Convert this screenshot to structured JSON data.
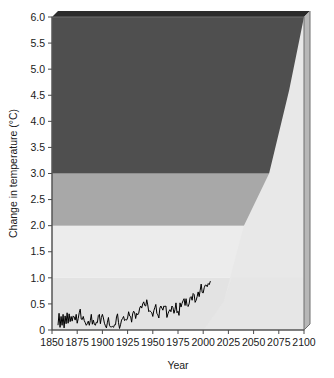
{
  "chart_data": {
    "type": "area",
    "title": "",
    "xlabel": "Year",
    "ylabel": "Change in temperature (°C)",
    "xlim": [
      1850,
      2100
    ],
    "ylim": [
      0,
      6
    ],
    "grid": false,
    "legend": null,
    "x_ticks": [
      1850,
      1875,
      1900,
      1925,
      1950,
      1975,
      2000,
      2025,
      2050,
      2075,
      2100
    ],
    "x_tick_labels": [
      "1850",
      "1875",
      "1900",
      "1925",
      "1950",
      "1975",
      "2000",
      "2025",
      "2050",
      "2075",
      "2100"
    ],
    "y_ticks": [
      0,
      0.5,
      1.0,
      1.5,
      2.0,
      2.5,
      3.0,
      3.5,
      4.0,
      4.5,
      5.0,
      5.5,
      6.0
    ],
    "y_tick_labels": [
      "0",
      "0.5",
      "1.0",
      "1.5",
      "2.0",
      "2.5",
      "3.0",
      "3.5",
      "4.0",
      "4.5",
      "5.0",
      "5.5",
      "6.0"
    ],
    "bands": [
      {
        "name": "below-1C-band",
        "label": "Below 1.0 °C",
        "y_range": [
          0,
          1.0
        ],
        "color": "#e3e3e3"
      },
      {
        "name": "1-to-2C-band",
        "label": "1.0 to 2.0 °C",
        "y_range": [
          1.0,
          2.0
        ],
        "color": "#ececec"
      },
      {
        "name": "2-to-3C-band",
        "label": "2.0 to 3.0 °C",
        "y_range": [
          2.0,
          3.0
        ],
        "color": "#a8a8a8"
      },
      {
        "name": "above-3C-band",
        "label": "Above 3.0 °C",
        "y_range": [
          3.0,
          6.0
        ],
        "color": "#4f4f4f"
      }
    ],
    "projection_wedge": {
      "name": "projection-uncertainty-wedge",
      "color": "#e8e8e8",
      "description": "Light wedge rising from baseline toward upper right, overlaying the shaded bands",
      "boundary_points": [
        {
          "x": 2000,
          "y": 0.0
        },
        {
          "x": 2020,
          "y": 0.55
        },
        {
          "x": 2040,
          "y": 2.0
        },
        {
          "x": 2065,
          "y": 3.0
        },
        {
          "x": 2085,
          "y": 4.6
        },
        {
          "x": 2100,
          "y": 6.0
        }
      ]
    },
    "series": [
      {
        "name": "observed-global-temperature",
        "label": "Observed change in temperature",
        "color": "#000000",
        "x_start": 1856,
        "x_end": 2007,
        "points": [
          [
            1856,
            0.1
          ],
          [
            1857,
            0.32
          ],
          [
            1858,
            0.05
          ],
          [
            1859,
            0.26
          ],
          [
            1860,
            0.09
          ],
          [
            1861,
            0.3
          ],
          [
            1862,
            0.04
          ],
          [
            1863,
            0.27
          ],
          [
            1864,
            0.12
          ],
          [
            1865,
            0.33
          ],
          [
            1866,
            0.13
          ],
          [
            1867,
            0.31
          ],
          [
            1868,
            0.16
          ],
          [
            1869,
            0.26
          ],
          [
            1870,
            0.17
          ],
          [
            1871,
            0.27
          ],
          [
            1872,
            0.25
          ],
          [
            1873,
            0.19
          ],
          [
            1874,
            0.3
          ],
          [
            1875,
            0.13
          ],
          [
            1876,
            0.22
          ],
          [
            1877,
            0.33
          ],
          [
            1878,
            0.4
          ],
          [
            1879,
            0.21
          ],
          [
            1880,
            0.2
          ],
          [
            1881,
            0.26
          ],
          [
            1882,
            0.18
          ],
          [
            1883,
            0.14
          ],
          [
            1884,
            0.09
          ],
          [
            1885,
            0.12
          ],
          [
            1886,
            0.17
          ],
          [
            1887,
            0.09
          ],
          [
            1888,
            0.18
          ],
          [
            1889,
            0.3
          ],
          [
            1890,
            0.11
          ],
          [
            1891,
            0.19
          ],
          [
            1892,
            0.11
          ],
          [
            1893,
            0.09
          ],
          [
            1894,
            0.15
          ],
          [
            1895,
            0.14
          ],
          [
            1896,
            0.28
          ],
          [
            1897,
            0.3
          ],
          [
            1898,
            0.12
          ],
          [
            1899,
            0.24
          ],
          [
            1900,
            0.3
          ],
          [
            1901,
            0.23
          ],
          [
            1902,
            0.13
          ],
          [
            1903,
            0.08
          ],
          [
            1904,
            0.04
          ],
          [
            1905,
            0.15
          ],
          [
            1906,
            0.24
          ],
          [
            1907,
            0.09
          ],
          [
            1908,
            0.06
          ],
          [
            1909,
            0.06
          ],
          [
            1910,
            0.07
          ],
          [
            1911,
            0.05
          ],
          [
            1912,
            0.1
          ],
          [
            1913,
            0.1
          ],
          [
            1914,
            0.25
          ],
          [
            1915,
            0.31
          ],
          [
            1916,
            0.14
          ],
          [
            1917,
            0.03
          ],
          [
            1918,
            0.1
          ],
          [
            1919,
            0.19
          ],
          [
            1920,
            0.22
          ],
          [
            1921,
            0.26
          ],
          [
            1922,
            0.18
          ],
          [
            1923,
            0.2
          ],
          [
            1924,
            0.19
          ],
          [
            1925,
            0.23
          ],
          [
            1926,
            0.35
          ],
          [
            1927,
            0.27
          ],
          [
            1928,
            0.26
          ],
          [
            1929,
            0.15
          ],
          [
            1930,
            0.31
          ],
          [
            1931,
            0.36
          ],
          [
            1932,
            0.33
          ],
          [
            1933,
            0.22
          ],
          [
            1934,
            0.32
          ],
          [
            1935,
            0.29
          ],
          [
            1936,
            0.32
          ],
          [
            1937,
            0.42
          ],
          [
            1938,
            0.46
          ],
          [
            1939,
            0.42
          ],
          [
            1940,
            0.5
          ],
          [
            1941,
            0.54
          ],
          [
            1942,
            0.47
          ],
          [
            1943,
            0.46
          ],
          [
            1944,
            0.58
          ],
          [
            1945,
            0.48
          ],
          [
            1946,
            0.35
          ],
          [
            1947,
            0.37
          ],
          [
            1948,
            0.35
          ],
          [
            1949,
            0.33
          ],
          [
            1950,
            0.26
          ],
          [
            1951,
            0.37
          ],
          [
            1952,
            0.43
          ],
          [
            1953,
            0.49
          ],
          [
            1954,
            0.32
          ],
          [
            1955,
            0.29
          ],
          [
            1956,
            0.23
          ],
          [
            1957,
            0.42
          ],
          [
            1958,
            0.46
          ],
          [
            1959,
            0.42
          ],
          [
            1960,
            0.38
          ],
          [
            1961,
            0.46
          ],
          [
            1962,
            0.45
          ],
          [
            1963,
            0.46
          ],
          [
            1964,
            0.24
          ],
          [
            1965,
            0.31
          ],
          [
            1966,
            0.36
          ],
          [
            1967,
            0.39
          ],
          [
            1968,
            0.35
          ],
          [
            1969,
            0.46
          ],
          [
            1970,
            0.43
          ],
          [
            1971,
            0.32
          ],
          [
            1972,
            0.39
          ],
          [
            1973,
            0.52
          ],
          [
            1974,
            0.33
          ],
          [
            1975,
            0.36
          ],
          [
            1976,
            0.28
          ],
          [
            1977,
            0.52
          ],
          [
            1978,
            0.44
          ],
          [
            1979,
            0.51
          ],
          [
            1980,
            0.56
          ],
          [
            1981,
            0.6
          ],
          [
            1982,
            0.47
          ],
          [
            1983,
            0.6
          ],
          [
            1984,
            0.47
          ],
          [
            1985,
            0.45
          ],
          [
            1986,
            0.5
          ],
          [
            1987,
            0.62
          ],
          [
            1988,
            0.64
          ],
          [
            1989,
            0.57
          ],
          [
            1990,
            0.7
          ],
          [
            1991,
            0.68
          ],
          [
            1992,
            0.53
          ],
          [
            1993,
            0.57
          ],
          [
            1994,
            0.64
          ],
          [
            1995,
            0.73
          ],
          [
            1996,
            0.64
          ],
          [
            1997,
            0.76
          ],
          [
            1998,
            0.88
          ],
          [
            1999,
            0.72
          ],
          [
            2000,
            0.71
          ],
          [
            2001,
            0.81
          ],
          [
            2002,
            0.86
          ],
          [
            2003,
            0.86
          ],
          [
            2004,
            0.83
          ],
          [
            2005,
            0.89
          ],
          [
            2006,
            0.87
          ],
          [
            2007,
            0.93
          ]
        ]
      }
    ]
  },
  "axes": {
    "x_axis_name": "x-axis",
    "y_axis_name": "y-axis"
  },
  "style": {
    "plot_background": "#ececec",
    "depth_shadow_color": "#2b2b2b",
    "depth_side_color": "#b7b7b7",
    "frame_color": "#6e6e6e"
  }
}
